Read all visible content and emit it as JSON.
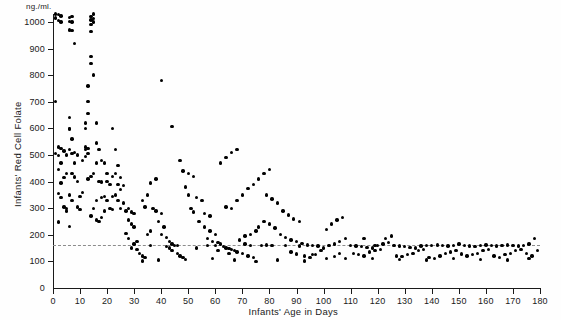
{
  "chart_data": {
    "type": "scatter",
    "title": "",
    "xlabel": "Infants' Age in Days",
    "ylabel": "Infants' Red Cell Folate",
    "yunit": "ng./ml.",
    "xlim": [
      0,
      180
    ],
    "ylim": [
      0,
      1030
    ],
    "grid": false,
    "legend": null,
    "xticks": [
      0,
      10,
      20,
      30,
      40,
      50,
      60,
      70,
      80,
      90,
      100,
      110,
      120,
      130,
      140,
      150,
      160,
      170,
      180
    ],
    "yticks": [
      0,
      100,
      200,
      300,
      400,
      500,
      600,
      700,
      800,
      900,
      1000
    ],
    "annotations": [
      {
        "type": "hline",
        "y": 160,
        "style": "dashed",
        "color": "#8c8c8c"
      }
    ],
    "marker": {
      "shape": "circle",
      "color": "#000000",
      "size": 3.4
    },
    "points": [
      [
        1,
        1030
      ],
      [
        1,
        1015
      ],
      [
        2,
        1028
      ],
      [
        2,
        1005
      ],
      [
        3,
        1022
      ],
      [
        3,
        1000
      ],
      [
        1,
        700
      ],
      [
        1,
        505
      ],
      [
        2,
        498
      ],
      [
        2,
        445
      ],
      [
        3,
        470
      ],
      [
        3,
        395
      ],
      [
        2,
        355
      ],
      [
        3,
        340
      ],
      [
        2,
        248
      ],
      [
        4,
        415
      ],
      [
        4,
        305
      ],
      [
        5,
        430
      ],
      [
        5,
        300
      ],
      [
        4,
        515
      ],
      [
        5,
        500
      ],
      [
        3,
        525
      ],
      [
        2,
        530
      ],
      [
        6,
        1018
      ],
      [
        6,
        1002
      ],
      [
        7,
        1020
      ],
      [
        7,
        1000
      ],
      [
        6,
        970
      ],
      [
        7,
        968
      ],
      [
        8,
        920
      ],
      [
        6,
        640
      ],
      [
        6,
        600
      ],
      [
        6,
        598
      ],
      [
        7,
        560
      ],
      [
        6,
        520
      ],
      [
        7,
        505
      ],
      [
        8,
        510
      ],
      [
        9,
        500
      ],
      [
        8,
        470
      ],
      [
        7,
        430
      ],
      [
        8,
        418
      ],
      [
        9,
        400
      ],
      [
        6,
        350
      ],
      [
        7,
        330
      ],
      [
        5,
        290
      ],
      [
        6,
        232
      ],
      [
        9,
        305
      ],
      [
        10,
        295
      ],
      [
        10,
        345
      ],
      [
        11,
        360
      ],
      [
        12,
        520
      ],
      [
        12,
        530
      ],
      [
        13,
        525
      ],
      [
        13,
        505
      ],
      [
        12,
        495
      ],
      [
        11,
        480
      ],
      [
        14,
        1020
      ],
      [
        14,
        1008
      ],
      [
        14,
        990
      ],
      [
        14,
        965
      ],
      [
        15,
        1030
      ],
      [
        15,
        1012
      ],
      [
        15,
        1000
      ],
      [
        14,
        870
      ],
      [
        14,
        845
      ],
      [
        15,
        800
      ],
      [
        13,
        760
      ],
      [
        13,
        700
      ],
      [
        13,
        655
      ],
      [
        12,
        620
      ],
      [
        12,
        600
      ],
      [
        16,
        620
      ],
      [
        16,
        545
      ],
      [
        17,
        520
      ],
      [
        16,
        470
      ],
      [
        15,
        430
      ],
      [
        14,
        420
      ],
      [
        13,
        410
      ],
      [
        17,
        400
      ],
      [
        18,
        398
      ],
      [
        16,
        330
      ],
      [
        15,
        300
      ],
      [
        14,
        270
      ],
      [
        16,
        255
      ],
      [
        17,
        250
      ],
      [
        18,
        340
      ],
      [
        19,
        345
      ],
      [
        20,
        430
      ],
      [
        20,
        400
      ],
      [
        21,
        390
      ],
      [
        19,
        470
      ],
      [
        18,
        480
      ],
      [
        20,
        330
      ],
      [
        21,
        300
      ],
      [
        22,
        295
      ],
      [
        19,
        290
      ],
      [
        18,
        265
      ],
      [
        22,
        600
      ],
      [
        23,
        520
      ],
      [
        24,
        460
      ],
      [
        23,
        430
      ],
      [
        22,
        420
      ],
      [
        25,
        415
      ],
      [
        24,
        390
      ],
      [
        26,
        385
      ],
      [
        25,
        370
      ],
      [
        23,
        350
      ],
      [
        22,
        345
      ],
      [
        24,
        330
      ],
      [
        26,
        320
      ],
      [
        25,
        300
      ],
      [
        27,
        290
      ],
      [
        28,
        300
      ],
      [
        29,
        285
      ],
      [
        30,
        280
      ],
      [
        28,
        255
      ],
      [
        29,
        240
      ],
      [
        30,
        230
      ],
      [
        27,
        205
      ],
      [
        28,
        185
      ],
      [
        30,
        165
      ],
      [
        29,
        150
      ],
      [
        31,
        145
      ],
      [
        32,
        130
      ],
      [
        33,
        120
      ],
      [
        34,
        115
      ],
      [
        35,
        200
      ],
      [
        36,
        215
      ],
      [
        34,
        305
      ],
      [
        33,
        330
      ],
      [
        35,
        350
      ],
      [
        36,
        395
      ],
      [
        38,
        410
      ],
      [
        37,
        300
      ],
      [
        38,
        290
      ],
      [
        40,
        280
      ],
      [
        39,
        250
      ],
      [
        41,
        230
      ],
      [
        40,
        200
      ],
      [
        42,
        190
      ],
      [
        43,
        175
      ],
      [
        44,
        165
      ],
      [
        45,
        160
      ],
      [
        46,
        160
      ],
      [
        43,
        150
      ],
      [
        44,
        140
      ],
      [
        46,
        130
      ],
      [
        47,
        120
      ],
      [
        48,
        115
      ],
      [
        40,
        780
      ],
      [
        44,
        608
      ],
      [
        47,
        480
      ],
      [
        48,
        440
      ],
      [
        50,
        430
      ],
      [
        52,
        420
      ],
      [
        49,
        380
      ],
      [
        50,
        350
      ],
      [
        53,
        340
      ],
      [
        55,
        330
      ],
      [
        51,
        300
      ],
      [
        52,
        285
      ],
      [
        56,
        280
      ],
      [
        58,
        270
      ],
      [
        54,
        250
      ],
      [
        56,
        230
      ],
      [
        58,
        215
      ],
      [
        60,
        200
      ],
      [
        57,
        185
      ],
      [
        59,
        175
      ],
      [
        61,
        170
      ],
      [
        62,
        165
      ],
      [
        60,
        160
      ],
      [
        63,
        155
      ],
      [
        64,
        150
      ],
      [
        65,
        148
      ],
      [
        66,
        145
      ],
      [
        67,
        140
      ],
      [
        68,
        135
      ],
      [
        70,
        130
      ],
      [
        72,
        120
      ],
      [
        74,
        115
      ],
      [
        69,
        180
      ],
      [
        71,
        195
      ],
      [
        73,
        200
      ],
      [
        75,
        215
      ],
      [
        76,
        230
      ],
      [
        64,
        305
      ],
      [
        66,
        300
      ],
      [
        68,
        330
      ],
      [
        70,
        350
      ],
      [
        72,
        375
      ],
      [
        74,
        390
      ],
      [
        76,
        410
      ],
      [
        78,
        430
      ],
      [
        80,
        445
      ],
      [
        62,
        470
      ],
      [
        64,
        490
      ],
      [
        66,
        510
      ],
      [
        68,
        520
      ],
      [
        78,
        250
      ],
      [
        80,
        240
      ],
      [
        82,
        225
      ],
      [
        84,
        200
      ],
      [
        86,
        190
      ],
      [
        88,
        180
      ],
      [
        90,
        175
      ],
      [
        92,
        168
      ],
      [
        94,
        162
      ],
      [
        96,
        160
      ],
      [
        98,
        158
      ],
      [
        85,
        290
      ],
      [
        87,
        275
      ],
      [
        89,
        260
      ],
      [
        91,
        250
      ],
      [
        83,
        320
      ],
      [
        81,
        335
      ],
      [
        79,
        350
      ],
      [
        88,
        135
      ],
      [
        90,
        128
      ],
      [
        93,
        120
      ],
      [
        95,
        115
      ],
      [
        97,
        125
      ],
      [
        99,
        140
      ],
      [
        100,
        150
      ],
      [
        102,
        160
      ],
      [
        104,
        165
      ],
      [
        106,
        175
      ],
      [
        108,
        185
      ],
      [
        101,
        220
      ],
      [
        103,
        240
      ],
      [
        105,
        255
      ],
      [
        107,
        265
      ],
      [
        110,
        160
      ],
      [
        112,
        158
      ],
      [
        114,
        155
      ],
      [
        116,
        152
      ],
      [
        118,
        150
      ],
      [
        120,
        160
      ],
      [
        122,
        165
      ],
      [
        124,
        170
      ],
      [
        111,
        130
      ],
      [
        113,
        125
      ],
      [
        115,
        120
      ],
      [
        117,
        135
      ],
      [
        119,
        140
      ],
      [
        121,
        145
      ],
      [
        123,
        185
      ],
      [
        125,
        195
      ],
      [
        126,
        160
      ],
      [
        128,
        158
      ],
      [
        130,
        155
      ],
      [
        132,
        152
      ],
      [
        134,
        150
      ],
      [
        136,
        158
      ],
      [
        127,
        120
      ],
      [
        129,
        118
      ],
      [
        131,
        125
      ],
      [
        133,
        130
      ],
      [
        135,
        140
      ],
      [
        137,
        145
      ],
      [
        138,
        160
      ],
      [
        140,
        160
      ],
      [
        142,
        162
      ],
      [
        144,
        160
      ],
      [
        146,
        158
      ],
      [
        148,
        160
      ],
      [
        139,
        115
      ],
      [
        141,
        110
      ],
      [
        143,
        120
      ],
      [
        145,
        130
      ],
      [
        147,
        135
      ],
      [
        149,
        140
      ],
      [
        150,
        165
      ],
      [
        152,
        160
      ],
      [
        154,
        158
      ],
      [
        156,
        155
      ],
      [
        158,
        160
      ],
      [
        160,
        162
      ],
      [
        151,
        128
      ],
      [
        153,
        120
      ],
      [
        155,
        125
      ],
      [
        157,
        130
      ],
      [
        159,
        140
      ],
      [
        161,
        145
      ],
      [
        162,
        160
      ],
      [
        164,
        158
      ],
      [
        166,
        160
      ],
      [
        168,
        162
      ],
      [
        170,
        160
      ],
      [
        172,
        158
      ],
      [
        163,
        120
      ],
      [
        165,
        115
      ],
      [
        167,
        125
      ],
      [
        169,
        130
      ],
      [
        171,
        140
      ],
      [
        173,
        145
      ],
      [
        174,
        160
      ],
      [
        176,
        165
      ],
      [
        178,
        185
      ],
      [
        175,
        130
      ],
      [
        177,
        120
      ],
      [
        179,
        140
      ],
      [
        104,
        118
      ],
      [
        108,
        112
      ],
      [
        118,
        110
      ],
      [
        128,
        108
      ],
      [
        138,
        105
      ],
      [
        148,
        112
      ],
      [
        158,
        108
      ],
      [
        168,
        105
      ],
      [
        176,
        110
      ],
      [
        93,
        102
      ],
      [
        83,
        105
      ],
      [
        75,
        100
      ],
      [
        67,
        105
      ],
      [
        59,
        110
      ],
      [
        49,
        108
      ],
      [
        39,
        105
      ],
      [
        33,
        102
      ],
      [
        31,
        175
      ],
      [
        36,
        160
      ],
      [
        42,
        155
      ],
      [
        53,
        150
      ],
      [
        57,
        160
      ],
      [
        61,
        140
      ],
      [
        65,
        130
      ],
      [
        71,
        165
      ],
      [
        73,
        160
      ],
      [
        77,
        160
      ],
      [
        79,
        162
      ],
      [
        81,
        160
      ],
      [
        86,
        160
      ],
      [
        91,
        158
      ],
      [
        96,
        125
      ],
      [
        101,
        112
      ],
      [
        106,
        130
      ],
      [
        115,
        185
      ],
      [
        119,
        160
      ]
    ]
  }
}
